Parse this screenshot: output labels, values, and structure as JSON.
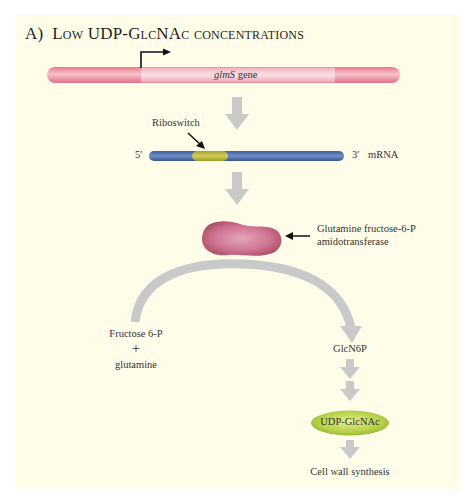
{
  "figure": {
    "panel_label": "A)",
    "title": "Low UDP-GlcNAc concentrations",
    "background_color": "#fffde9"
  },
  "gene": {
    "label_italic": "glmS",
    "label_rest": " gene",
    "color": "#f09aa8"
  },
  "mrna": {
    "five_prime": "5′",
    "three_prime": "3′",
    "label": "mRNA",
    "riboswitch_label": "Riboswitch",
    "color": "#4a6fb0",
    "riboswitch_color": "#b8b43a"
  },
  "enzyme": {
    "label_line1": "Glutamine fructose-6-P",
    "label_line2": "amidotransferase",
    "color": "#c05a78"
  },
  "pathway": {
    "substrate_line1": "Fructose 6-P",
    "plus": "+",
    "substrate_line2": "glutamine",
    "product": "GlcN6P",
    "end_metabolite": "UDP-GlcNAc",
    "end_metabolite_color": "#a8c83c",
    "outcome": "Cell wall synthesis",
    "arrow_color": "#c9c9c9"
  }
}
